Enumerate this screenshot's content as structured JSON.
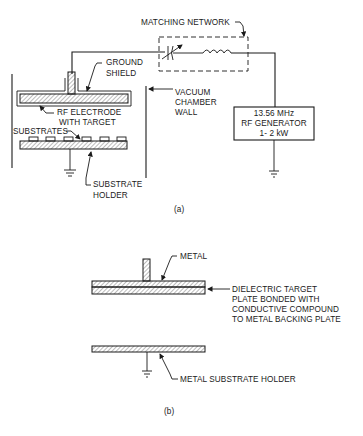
{
  "figure_a": {
    "caption": "(a)",
    "labels": {
      "matching_network": "MATCHING NETWORK",
      "ground_shield_1": "GROUND",
      "ground_shield_2": "SHIELD",
      "vacuum_1": "VACUUM",
      "vacuum_2": "CHAMBER",
      "vacuum_3": "WALL",
      "rf_electrode_1": "RF ELECTRODE",
      "rf_electrode_2": "WITH TARGET",
      "substrates": "SUBSTRATES",
      "substrate_holder_1": "SUBSTRATE",
      "substrate_holder_2": "HOLDER",
      "generator_1": "13.56 MHz",
      "generator_2": "RF GENERATOR",
      "generator_3": "1- 2 kW"
    }
  },
  "figure_b": {
    "caption": "(b)",
    "labels": {
      "metal": "METAL",
      "dielectric_1": "DIELECTRIC TARGET",
      "dielectric_2": "PLATE BONDED WITH",
      "dielectric_3": "CONDUCTIVE COMPOUND",
      "dielectric_4": "TO METAL BACKING PLATE",
      "metal_holder": "METAL SUBSTRATE HOLDER"
    }
  },
  "colors": {
    "ink": "#1a1a1a",
    "background": "#ffffff"
  }
}
